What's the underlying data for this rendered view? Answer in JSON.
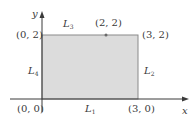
{
  "diagram": {
    "type": "rectangle-region-on-axes",
    "colors": {
      "fill": "#dcdcdc",
      "stroke": "#8a8a8a",
      "axis": "#3a3a3a",
      "text": "#3a3a3a"
    },
    "axes": {
      "x_label": "x",
      "y_label": "y"
    },
    "vertices": [
      {
        "label": "(0, 0)",
        "x": 0,
        "y": 0
      },
      {
        "label": "(3, 0)",
        "x": 3,
        "y": 0
      },
      {
        "label": "(3, 2)",
        "x": 3,
        "y": 2
      },
      {
        "label": "(0, 2)",
        "x": 0,
        "y": 2
      }
    ],
    "marked_point": {
      "label": "(2, 2)",
      "x": 2,
      "y": 2
    },
    "sides": [
      {
        "name": "L",
        "sub": "1",
        "position": "bottom"
      },
      {
        "name": "L",
        "sub": "2",
        "position": "right"
      },
      {
        "name": "L",
        "sub": "3",
        "position": "top"
      },
      {
        "name": "L",
        "sub": "4",
        "position": "left"
      }
    ]
  }
}
